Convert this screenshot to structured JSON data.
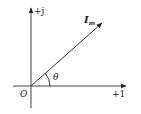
{
  "diagram": {
    "type": "phasor",
    "axes": {
      "vertical_label": "+j",
      "horizontal_label": "+1",
      "origin_label": "O"
    },
    "phasor": {
      "label_main": "I",
      "label_sub": "m",
      "angle_label": "θ"
    },
    "colors": {
      "line": "#222222",
      "background": "#ffffff"
    }
  }
}
